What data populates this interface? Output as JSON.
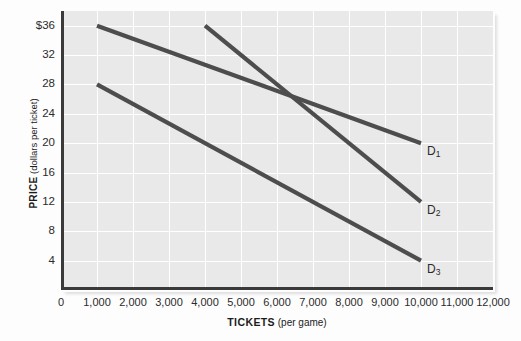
{
  "chart_data": {
    "type": "line",
    "title": "",
    "xlabel_strong": "TICKETS",
    "xlabel_rest": " (per game)",
    "ylabel_strong": "PRICE",
    "ylabel_rest": " (dollars per ticket)",
    "xlim": [
      0,
      12000
    ],
    "ylim": [
      0,
      38
    ],
    "x_ticks": [
      0,
      1000,
      2000,
      3000,
      4000,
      5000,
      6000,
      7000,
      8000,
      9000,
      10000,
      11000,
      12000
    ],
    "x_tick_labels": [
      "0",
      "1,000",
      "2,000",
      "3,000",
      "4,000",
      "5,000",
      "6,000",
      "7,000",
      "8,000",
      "9,000",
      "10,000",
      "11,000",
      "12,000"
    ],
    "y_ticks": [
      4,
      8,
      12,
      16,
      20,
      24,
      28,
      32,
      36
    ],
    "y_tick_labels": [
      "4",
      "8",
      "12",
      "16",
      "20",
      "24",
      "28",
      "32",
      "$36"
    ],
    "grid": true,
    "legend_position": "inline-right-end",
    "series": [
      {
        "name": "D1",
        "label_text": "D",
        "label_sub": "1",
        "points": [
          [
            1000,
            36
          ],
          [
            10000,
            20
          ]
        ],
        "color": "#4d4d4d"
      },
      {
        "name": "D2",
        "label_text": "D",
        "label_sub": "2",
        "points": [
          [
            4000,
            36
          ],
          [
            10000,
            12
          ]
        ],
        "color": "#4d4d4d"
      },
      {
        "name": "D3",
        "label_text": "D",
        "label_sub": "3",
        "points": [
          [
            1000,
            28
          ],
          [
            10000,
            4
          ]
        ],
        "color": "#4d4d4d"
      }
    ]
  },
  "style": {
    "plot_background": "#e9e9e9",
    "grid_color": "#ffffff",
    "axis_color": "#3a3a3a",
    "line_color": "#4d4d4d",
    "text_color": "#2b2b2b",
    "page_background": "#fdfdfd"
  }
}
